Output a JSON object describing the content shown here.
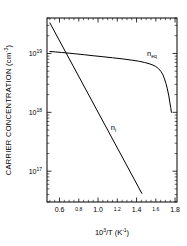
{
  "chart_data": {
    "type": "line",
    "title": "",
    "xlabel": "10^3/T (K^-1)",
    "ylabel": "CARRIER CONCENTRATION (cm^-3)",
    "xlabel_parts": {
      "base": "10",
      "exp": "3",
      "mid": "/T  (K",
      "exp2": "-1",
      "tail": ")"
    },
    "ylabel_parts": {
      "main": "CARRIER CONCENTRATION (cm",
      "exp": "-3",
      "tail": ")"
    },
    "x_scale": "linear",
    "y_scale": "log",
    "xlim": [
      0.47,
      1.82
    ],
    "ylim": [
      3e+16,
      4e+19
    ],
    "grid": false,
    "legend_position": "inline-annotation",
    "x_ticks": [
      {
        "value": 0.6,
        "label": "0.6",
        "size": "large"
      },
      {
        "value": 0.8,
        "label": "0.8",
        "size": "small"
      },
      {
        "value": 1.0,
        "label": "1.0",
        "size": "large"
      },
      {
        "value": 1.2,
        "label": "1.2",
        "size": "small"
      },
      {
        "value": 1.4,
        "label": "1.4",
        "size": "large"
      },
      {
        "value": 1.6,
        "label": "1.6",
        "size": "small"
      },
      {
        "value": 1.8,
        "label": "1.8",
        "size": "large"
      }
    ],
    "y_ticks": [
      {
        "value": 1e+17,
        "label": "10",
        "exp": "17"
      },
      {
        "value": 1e+18,
        "label": "10",
        "exp": "18"
      },
      {
        "value": 1e+19,
        "label": "10",
        "exp": "19"
      }
    ],
    "series": [
      {
        "name": "n_eq",
        "label_base": "n",
        "label_sub": "eq",
        "label_x": 1.56,
        "label_y": 9e+18,
        "color": "#000000",
        "x": [
          0.5,
          0.56,
          0.62,
          0.7,
          0.78,
          0.86,
          0.95,
          1.05,
          1.15,
          1.25,
          1.35,
          1.42,
          1.48,
          1.53,
          1.57,
          1.6,
          1.63,
          1.655,
          1.675,
          1.69,
          1.705,
          1.72,
          1.735,
          1.745,
          1.755,
          1.762
        ],
        "y": [
          1.08e+19,
          1.06e+19,
          1.04e+19,
          1.01e+19,
          9.8e+18,
          9.5e+18,
          9.15e+18,
          8.8e+18,
          8.45e+18,
          8.1e+18,
          7.7e+18,
          7.4e+18,
          7.05e+18,
          6.7e+18,
          6.35e+18,
          6e+18,
          5.5e+18,
          4.9e+18,
          4.3e+18,
          3.7e+18,
          3.1e+18,
          2.5e+18,
          1.9e+18,
          1.5e+18,
          1.2e+18,
          1e+18
        ]
      },
      {
        "name": "n_i",
        "label_base": "n",
        "label_sub": "i",
        "label_x": 1.16,
        "label_y": 5e+17,
        "color": "#000000",
        "x": [
          0.5,
          1.455
        ],
        "y": [
          3.3e+19,
          4.2e+16
        ]
      }
    ],
    "annotations": [
      {
        "text": "n_eq",
        "note": "equilibrium carrier concentration curve label"
      },
      {
        "text": "n_i",
        "note": "intrinsic carrier concentration line label"
      }
    ]
  },
  "figure": {
    "background": "#ffffff",
    "foreground": "#000000"
  }
}
